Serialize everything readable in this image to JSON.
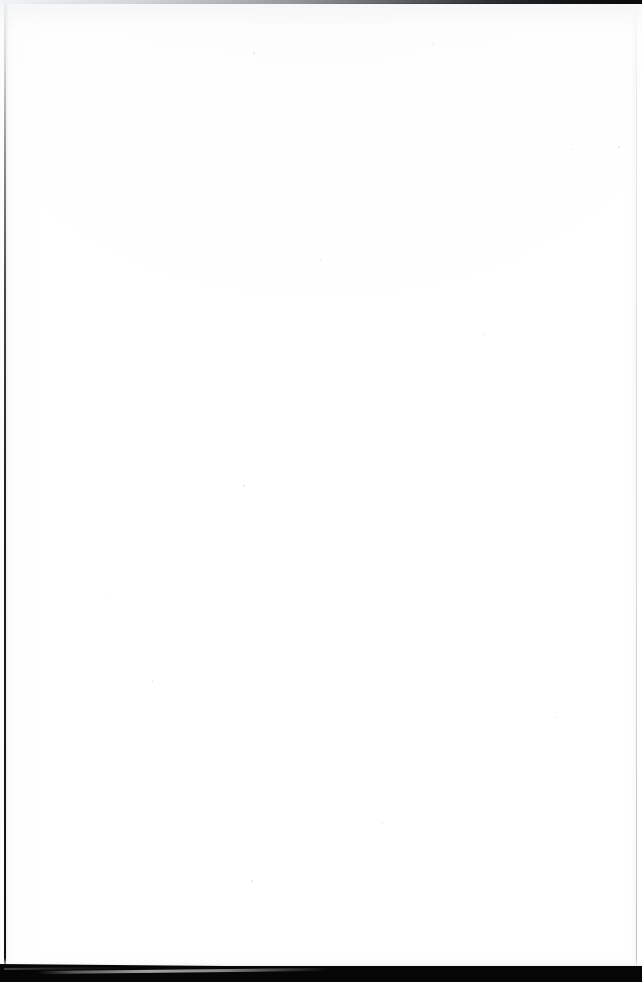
{
  "document": {
    "kind": "scanned-page",
    "page_content": "",
    "page_note": "blank page",
    "width_px": 642,
    "height_px": 982
  },
  "regions": {
    "top_edge_band": {
      "name": "top scanner edge band",
      "label": "",
      "color_left": "#f3f4f5",
      "color_right": "#0a0a0b"
    },
    "page_sheet": {
      "name": "blank paper sheet",
      "label": "",
      "color": "#ffffff"
    },
    "left_edge_line": {
      "name": "left page edge line",
      "label": "",
      "color": "#1e1f21"
    },
    "right_edge_line": {
      "name": "right page edge line",
      "label": "",
      "color": "#d4d6d8"
    },
    "bottom_void": {
      "name": "bottom dark band",
      "label": "",
      "color": "#060607"
    },
    "bottom_edge_streak": {
      "name": "lit page edge streak",
      "label": "",
      "color": "#babcbf"
    }
  },
  "specks": [
    {
      "x": 253,
      "y": 48,
      "w": 2,
      "h": 2
    },
    {
      "x": 433,
      "y": 39,
      "w": 1,
      "h": 3
    },
    {
      "x": 618,
      "y": 142,
      "w": 2,
      "h": 2
    },
    {
      "x": 572,
      "y": 145,
      "w": 2,
      "h": 1
    },
    {
      "x": 320,
      "y": 255,
      "w": 1,
      "h": 2
    },
    {
      "x": 243,
      "y": 481,
      "w": 2,
      "h": 2
    },
    {
      "x": 152,
      "y": 676,
      "w": 1,
      "h": 2
    },
    {
      "x": 251,
      "y": 876,
      "w": 2,
      "h": 2
    },
    {
      "x": 484,
      "y": 330,
      "w": 1,
      "h": 2
    },
    {
      "x": 108,
      "y": 592,
      "w": 1,
      "h": 1
    },
    {
      "x": 556,
      "y": 713,
      "w": 2,
      "h": 1
    },
    {
      "x": 382,
      "y": 818,
      "w": 1,
      "h": 2
    }
  ]
}
